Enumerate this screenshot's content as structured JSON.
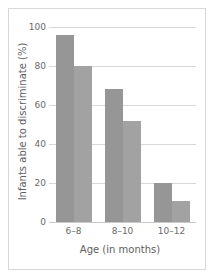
{
  "chart_data": {
    "type": "bar",
    "title": "",
    "subtitle": "",
    "xlabel": "Age (in months)",
    "ylabel": "Infants able to discriminate (%)",
    "categories": [
      "6–8",
      "8–10",
      "10–12"
    ],
    "series": [
      {
        "name": "bar-1",
        "values": [
          96,
          68,
          20
        ]
      },
      {
        "name": "bar-2",
        "values": [
          80,
          52,
          11
        ]
      }
    ],
    "ylim": [
      0,
      100
    ],
    "yticks": [
      0,
      20,
      40,
      60,
      80,
      100
    ],
    "ytick_labels": [
      "0",
      "20",
      "40",
      "60",
      "80",
      "100"
    ],
    "grid": true,
    "legend": "none",
    "bar_color": "#9a9a9a",
    "grid_color": "#d7d7d7",
    "frame_color": "#d8d8d8"
  }
}
